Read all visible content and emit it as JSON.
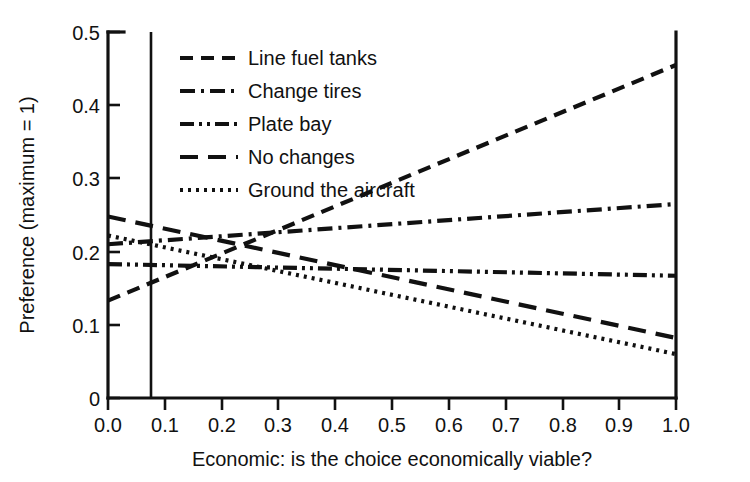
{
  "chart_data": {
    "type": "line",
    "title": "",
    "xlabel": "Economic: is the choice economically viable?",
    "ylabel": "Preference (maximum = 1)",
    "xlim": [
      0.0,
      1.0
    ],
    "ylim": [
      0.0,
      0.5
    ],
    "xticks": [
      "0.0",
      "0.1",
      "0.2",
      "0.3",
      "0.4",
      "0.5",
      "0.6",
      "0.7",
      "0.8",
      "0.9",
      "1.0"
    ],
    "xtick_values": [
      0.0,
      0.1,
      0.2,
      0.3,
      0.4,
      0.5,
      0.6,
      0.7,
      0.8,
      0.9,
      1.0
    ],
    "yticks": [
      "0",
      "0.1",
      "0.2",
      "0.3",
      "0.4",
      "0.5"
    ],
    "ytick_values": [
      0.0,
      0.1,
      0.2,
      0.3,
      0.4,
      0.5
    ],
    "grid": false,
    "legend_position": "upper-left-inside",
    "reference_line": {
      "orientation": "vertical",
      "x": 0.076,
      "style": "solid"
    },
    "x": [
      0.0,
      1.0
    ],
    "series": [
      {
        "name": "Line fuel tanks",
        "style": "dashed",
        "dasharray": "13,8",
        "values": [
          0.133,
          0.455
        ]
      },
      {
        "name": "Change tires",
        "style": "dash-dot",
        "dasharray": "15,6,3,6",
        "values": [
          0.21,
          0.265
        ]
      },
      {
        "name": "Plate bay",
        "style": "dash-dot-dot",
        "dasharray": "14,5,3,5,3,5",
        "values": [
          0.183,
          0.167
        ]
      },
      {
        "name": "No changes",
        "style": "long-dash",
        "dasharray": "18,10",
        "values": [
          0.248,
          0.082
        ]
      },
      {
        "name": "Ground the aircraft",
        "style": "dotted",
        "dasharray": "3,5",
        "values": [
          0.222,
          0.06
        ]
      }
    ]
  },
  "legend": {
    "items": [
      {
        "label": "Line fuel tanks"
      },
      {
        "label": "Change tires"
      },
      {
        "label": "Plate bay"
      },
      {
        "label": "No changes"
      },
      {
        "label": "Ground the aircraft"
      }
    ]
  },
  "axes": {
    "x_title": "Economic: is the choice economically viable?",
    "y_title": "Preference (maximum = 1)",
    "x_tick_labels": [
      "0.0",
      "0.1",
      "0.2",
      "0.3",
      "0.4",
      "0.5",
      "0.6",
      "0.7",
      "0.8",
      "0.9",
      "1.0"
    ],
    "y_tick_labels": [
      "0",
      "0.1",
      "0.2",
      "0.3",
      "0.4",
      "0.5"
    ]
  },
  "colors": {
    "ink": "#111111",
    "background": "#ffffff"
  }
}
